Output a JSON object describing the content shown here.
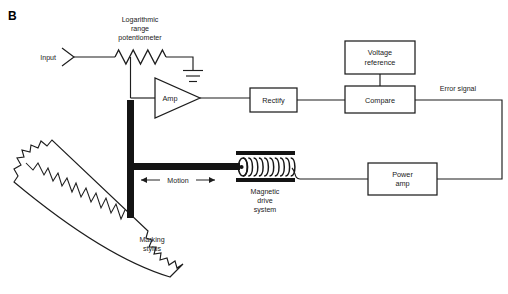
{
  "figure": {
    "panel_letter": "B",
    "width": 508,
    "height": 294,
    "background": "#ffffff",
    "line_color": "#1d1d1d",
    "solid_fill": "#141414"
  },
  "labels": {
    "input": "Input",
    "potentiometer_line1": "Logarithmic",
    "potentiometer_line2": "range",
    "potentiometer_line3": "potentiometer",
    "amp": "Amp",
    "rectify": "Rectify",
    "voltage_reference_line1": "Voltage",
    "voltage_reference_line2": "reference",
    "compare": "Compare",
    "error_signal": "Error signal",
    "power_amp_line1": "Power",
    "power_amp_line2": "amp",
    "magnetic_drive_line1": "Magnetic",
    "magnetic_drive_line2": "drive",
    "magnetic_drive_line3": "system",
    "motion": "Motion",
    "marking_stylus_line1": "Marking",
    "marking_stylus_line2": "stylus"
  },
  "blocks": [
    {
      "name": "rectify",
      "label": "Rectify",
      "x": 250,
      "y": 88,
      "w": 47,
      "h": 24
    },
    {
      "name": "voltage-reference",
      "label": "Voltage reference",
      "x": 345,
      "y": 41,
      "w": 70,
      "h": 33
    },
    {
      "name": "compare",
      "label": "Compare",
      "x": 345,
      "y": 86,
      "w": 70,
      "h": 27
    },
    {
      "name": "power-amp",
      "label": "Power amp",
      "x": 368,
      "y": 163,
      "w": 69,
      "h": 32
    }
  ],
  "symbols": {
    "amp_triangle": {
      "x1": 155,
      "y1": 78,
      "x2": 155,
      "y2": 118,
      "tip_x": 200,
      "tip_y": 98
    },
    "ground": {
      "x": 193,
      "y_top": 57,
      "bars": [
        12,
        8,
        5
      ]
    },
    "potentiometer": {
      "x_start": 115,
      "x_end": 166,
      "y": 57,
      "peaks": 7
    },
    "coil": {
      "x_start": 238,
      "x_end": 292,
      "y_center": 167,
      "turns": 10
    },
    "magnet_poles": {
      "x": 236,
      "w": 59,
      "y_top": 151,
      "y_bottom": 178,
      "thickness": 4
    },
    "stylus_arm": {
      "x": 127,
      "w": 7,
      "y_top": 100,
      "y_bottom": 218,
      "cross_y": 163,
      "cross_h": 7,
      "cross_x_end": 240
    }
  },
  "signal_flow": [
    "Input",
    "Logarithmic range potentiometer",
    "Amp",
    "Rectify",
    "Compare",
    "Error signal",
    "Power amp",
    "Magnetic drive system",
    "Marking stylus"
  ]
}
